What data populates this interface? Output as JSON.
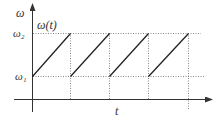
{
  "diagram": {
    "type": "sawtooth-frequency-plot",
    "y_axis_label": "ω",
    "x_axis_label": "t",
    "curve_label": "ω(t)",
    "levels": {
      "upper": "ω₂",
      "lower": "ω₁"
    },
    "teeth_count": 4,
    "colors": {
      "axis": "#333333",
      "curve": "#222222",
      "guides": "#888888"
    }
  }
}
